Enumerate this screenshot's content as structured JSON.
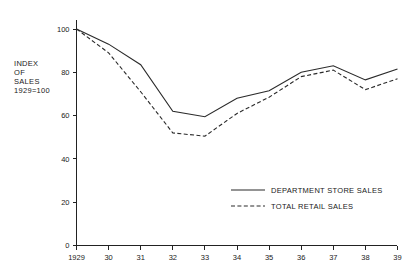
{
  "chart_data": {
    "type": "line",
    "title": "",
    "subtitle": "",
    "xlabel": "",
    "ylabel": "INDEX OF SALES 1929=100",
    "ylabel_lines": [
      "INDEX",
      "OF",
      "SALES",
      "1929=100"
    ],
    "categories": [
      "1929",
      "30",
      "31",
      "32",
      "33",
      "34",
      "35",
      "36",
      "37",
      "38",
      "39"
    ],
    "x_tick_labels": [
      "1929",
      "30",
      "31",
      "32",
      "33",
      "34",
      "35",
      "36",
      "37",
      "38",
      "39"
    ],
    "y_tick_labels": [
      "0",
      "20",
      "40",
      "60",
      "80",
      "100"
    ],
    "y_ticks": [
      0,
      20,
      40,
      60,
      80,
      100
    ],
    "ylim": [
      0,
      100
    ],
    "grid": false,
    "legend_position": "inside-lower-right",
    "series": [
      {
        "name": "DEPARTMENT STORE SALES",
        "style": "solid",
        "color": "#2a2a2a",
        "values": [
          100,
          93,
          83.5,
          62,
          59.5,
          68,
          71.5,
          80,
          83,
          76.5,
          81.5
        ]
      },
      {
        "name": "TOTAL RETAIL SALES",
        "style": "dashed",
        "color": "#2a2a2a",
        "values": [
          100,
          89,
          71,
          52,
          50.5,
          61,
          68.5,
          78,
          81,
          72,
          77
        ]
      }
    ]
  },
  "legend": {
    "items": [
      {
        "label": "DEPARTMENT STORE SALES",
        "style": "solid"
      },
      {
        "label": "TOTAL RETAIL SALES",
        "style": "dashed"
      }
    ]
  }
}
